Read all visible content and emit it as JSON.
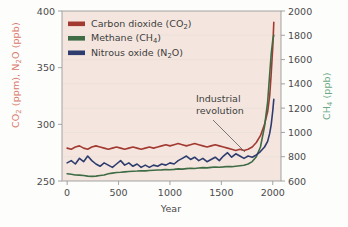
{
  "chart_data": {
    "type": "line",
    "title": "",
    "xlabel": "Year",
    "ylabel_left": "CO2 (ppm), N2O (ppb)",
    "ylabel_right": "CH4 (ppb)",
    "xlim": [
      -50,
      2080
    ],
    "xticks": [
      0,
      500,
      1000,
      1500,
      2000
    ],
    "ylim_left": [
      250,
      400
    ],
    "yticks_left": [
      250,
      300,
      350,
      400
    ],
    "ylim_right": [
      600,
      2000
    ],
    "yticks_right": [
      600,
      800,
      1000,
      1200,
      1400,
      1600,
      1800,
      2000
    ],
    "grid": true,
    "legend_position": "top-left",
    "plot_background": "#f4e6df",
    "annotations": [
      {
        "text_line1": "Industrial",
        "text_line2": "revolution"
      }
    ],
    "series": [
      {
        "name": "Carbon dioxide (CO2)",
        "label_main": "Carbon dioxide (CO",
        "label_sub": "2",
        "label_tail": ")",
        "color": "#a33a31",
        "axis": "left",
        "units": "ppm",
        "x": [
          0,
          40,
          80,
          120,
          160,
          200,
          240,
          280,
          320,
          360,
          400,
          440,
          480,
          520,
          560,
          600,
          640,
          680,
          720,
          760,
          800,
          840,
          880,
          920,
          960,
          1000,
          1040,
          1080,
          1120,
          1160,
          1200,
          1240,
          1280,
          1320,
          1360,
          1400,
          1440,
          1480,
          1520,
          1560,
          1600,
          1640,
          1680,
          1720,
          1760,
          1800,
          1840,
          1880,
          1920,
          1950,
          1970,
          1985,
          2000,
          2010
        ],
        "y": [
          279,
          278,
          280,
          281,
          279,
          278,
          280,
          281,
          280,
          279,
          278,
          279,
          280,
          279,
          278,
          279,
          280,
          279,
          278,
          279,
          280,
          279,
          280,
          281,
          282,
          281,
          282,
          283,
          282,
          281,
          282,
          283,
          282,
          281,
          280,
          281,
          282,
          281,
          280,
          279,
          278,
          277,
          278,
          277,
          278,
          280,
          284,
          290,
          300,
          311,
          325,
          345,
          368,
          390
        ]
      },
      {
        "name": "Methane (CH4)",
        "label_main": "Methane (CH",
        "label_sub": "4",
        "label_tail": ")",
        "color": "#3f6b45",
        "axis": "right",
        "units": "ppb",
        "x": [
          0,
          40,
          80,
          120,
          160,
          200,
          240,
          280,
          320,
          360,
          400,
          440,
          480,
          520,
          560,
          600,
          640,
          680,
          720,
          760,
          800,
          840,
          880,
          920,
          960,
          1000,
          1040,
          1080,
          1120,
          1160,
          1200,
          1240,
          1280,
          1320,
          1360,
          1400,
          1440,
          1480,
          1520,
          1560,
          1600,
          1640,
          1680,
          1720,
          1760,
          1800,
          1840,
          1880,
          1920,
          1950,
          1970,
          1985,
          2000,
          2010
        ],
        "y": [
          660,
          655,
          650,
          648,
          645,
          640,
          638,
          640,
          645,
          650,
          660,
          665,
          670,
          672,
          675,
          678,
          680,
          682,
          685,
          683,
          686,
          688,
          690,
          692,
          695,
          693,
          696,
          700,
          698,
          702,
          705,
          703,
          707,
          710,
          708,
          712,
          715,
          713,
          716,
          720,
          718,
          722,
          726,
          730,
          740,
          760,
          800,
          880,
          1050,
          1250,
          1480,
          1650,
          1760,
          1800
        ]
      },
      {
        "name": "Nitrous oxide (N2O)",
        "label_main": "Nitrous oxide (N",
        "label_sub": "2",
        "label_tail": "O)",
        "color": "#2f3c6e",
        "axis": "left",
        "units": "ppb",
        "x": [
          0,
          40,
          80,
          120,
          160,
          200,
          240,
          280,
          320,
          360,
          400,
          440,
          480,
          520,
          560,
          600,
          640,
          680,
          720,
          760,
          800,
          840,
          880,
          920,
          960,
          1000,
          1040,
          1080,
          1120,
          1160,
          1200,
          1240,
          1280,
          1320,
          1360,
          1400,
          1440,
          1480,
          1520,
          1560,
          1600,
          1640,
          1680,
          1720,
          1760,
          1800,
          1840,
          1880,
          1920,
          1950,
          1970,
          1985,
          2000,
          2010
        ],
        "y": [
          266,
          268,
          265,
          270,
          267,
          272,
          268,
          265,
          263,
          266,
          264,
          262,
          265,
          268,
          264,
          266,
          263,
          265,
          262,
          264,
          262,
          264,
          263,
          265,
          264,
          266,
          265,
          268,
          270,
          272,
          269,
          271,
          268,
          270,
          267,
          269,
          271,
          268,
          272,
          275,
          271,
          274,
          272,
          270,
          272,
          271,
          273,
          276,
          280,
          285,
          292,
          300,
          312,
          322
        ]
      }
    ]
  },
  "legend": {
    "items": [
      {
        "swatch_color": "#a33a31"
      },
      {
        "swatch_color": "#3f6b45"
      },
      {
        "swatch_color": "#2f3c6e"
      }
    ]
  },
  "axis_colors": {
    "left": "#d9776a",
    "right": "#6aa883",
    "frame": "#9a9a9a",
    "tick_text": "#4a4a4a"
  }
}
